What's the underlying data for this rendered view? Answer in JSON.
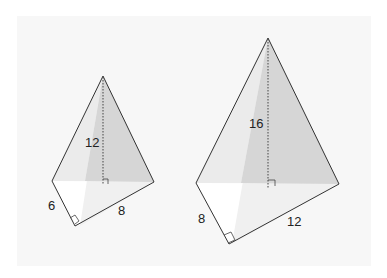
{
  "figure": {
    "pyramids": [
      {
        "name": "small-pyramid",
        "height_label": "12",
        "base_leg_a_label": "6",
        "base_leg_b_label": "8"
      },
      {
        "name": "large-pyramid",
        "height_label": "16",
        "base_leg_a_label": "8",
        "base_leg_b_label": "12"
      }
    ]
  },
  "colors": {
    "panel": "#f7f7f7",
    "face_light": "#ececec",
    "face_dark": "#d4d4d4",
    "base": "#f4f4f4",
    "edge": "#333333"
  }
}
